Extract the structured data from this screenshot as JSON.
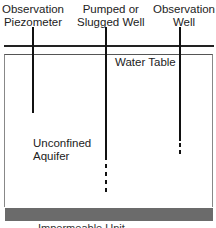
{
  "diagram": {
    "labels": {
      "observation_piezometer": [
        "Observation",
        "Piezometer"
      ],
      "pumped_well": [
        "Pumped or",
        "Slugged Well"
      ],
      "observation_well": [
        "Observation",
        "Well"
      ],
      "water_table": "Water Table",
      "aquifer": [
        "Unconfined",
        "Aquifer"
      ],
      "impermeable": "Impermeable Unit"
    },
    "colors": {
      "line": "#111111",
      "impermeable_layer": "#6b6b6b",
      "background": "#ffffff"
    }
  }
}
